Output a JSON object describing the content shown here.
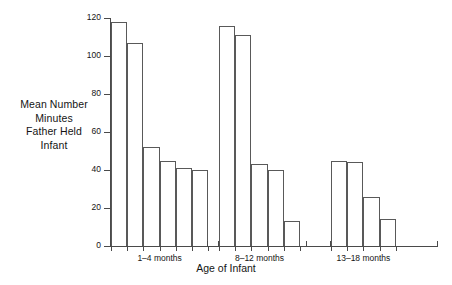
{
  "chart_data": {
    "type": "bar",
    "title": "",
    "xlabel": "Age of Infant",
    "ylabel": "Mean Number Minutes Father Held Infant",
    "ylabel_lines": [
      "Mean Number",
      "Minutes",
      "Father Held",
      "Infant"
    ],
    "ylim": [
      0,
      120
    ],
    "yticks": [
      0,
      20,
      40,
      60,
      80,
      100,
      120
    ],
    "ytick_labels": [
      "0",
      "20",
      "40",
      "60",
      "80",
      "100",
      "120"
    ],
    "grid": false,
    "legend": "none",
    "groups": [
      {
        "label": "1–4 months",
        "values": [
          118,
          107,
          52,
          45,
          41,
          40
        ]
      },
      {
        "label": "8–12 months",
        "values": [
          116,
          111,
          43,
          40,
          13
        ]
      },
      {
        "label": "13–18 months",
        "values": [
          45,
          44,
          26,
          14
        ]
      }
    ],
    "bar_face_color": "#ffffff",
    "bar_edge_color": "#595959",
    "axis_color": "#4a4a4a"
  }
}
